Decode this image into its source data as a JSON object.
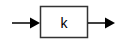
{
  "diagram": {
    "type": "block-diagram",
    "block": {
      "label": "k",
      "x": 40,
      "y": 6,
      "width": 48,
      "height": 32,
      "stroke": "#333333",
      "fill": "#ffffff"
    },
    "input_arrow": {
      "from": [
        12,
        23
      ],
      "to": [
        40,
        23
      ],
      "color": "#000000"
    },
    "output_arrow": {
      "from": [
        88,
        23
      ],
      "to": [
        115,
        23
      ],
      "color": "#000000"
    }
  }
}
